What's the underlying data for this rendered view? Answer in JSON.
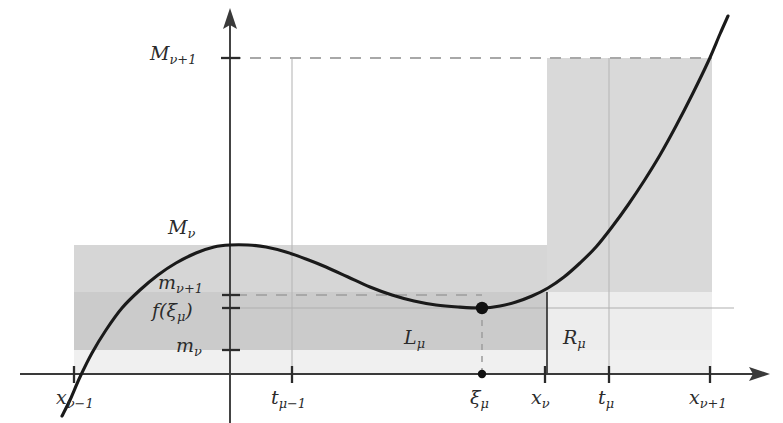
{
  "figure": {
    "type": "mathematical-diagram",
    "background_color": "#ffffff",
    "curve_color": "#1a1a1a",
    "band_color_dark": "#cfcfcf",
    "band_color_mid": "#dcdcdc",
    "band_color_light": "#ebebeb",
    "axis_color": "#3a3a3a",
    "guide_color": "#b5b5b5",
    "dashed_color": "#a8a8a8"
  },
  "y_axis_labels": {
    "m_upper_nu_plus_1": {
      "base": "M",
      "sub": "ν+1",
      "x": 150,
      "y": 54
    },
    "m_upper_nu": {
      "base": "M",
      "sub": "ν",
      "x": 168,
      "y": 228
    },
    "m_lower_nu_plus_1": {
      "base": "m",
      "sub": "ν+1",
      "x": 160,
      "y": 283
    },
    "f_xi_mu": {
      "base": "f(ξ",
      "sub": "μ",
      "tail": ")",
      "x": 156,
      "y": 312
    },
    "m_lower_nu": {
      "base": "m",
      "sub": "ν",
      "x": 178,
      "y": 346
    }
  },
  "x_axis_labels": {
    "x_nu_minus_1": {
      "base": "x",
      "sub": "ν−1",
      "x": 62,
      "y": 396
    },
    "t_mu_minus_1": {
      "base": "t",
      "sub": "μ−1",
      "x": 272,
      "y": 396
    },
    "xi_mu": {
      "base": "ξ",
      "sub": "μ",
      "x": 470,
      "y": 396
    },
    "x_nu": {
      "base": "x",
      "sub": "ν",
      "x": 532,
      "y": 396
    },
    "t_mu": {
      "base": "t",
      "sub": "μ",
      "x": 598,
      "y": 396
    },
    "x_nu_plus_1": {
      "base": "x",
      "sub": "ν+1",
      "x": 692,
      "y": 396
    }
  },
  "region_labels": {
    "l_mu": {
      "base": "L",
      "sub": "μ",
      "x": 405,
      "y": 338
    },
    "r_mu": {
      "base": "R",
      "sub": "μ",
      "x": 564,
      "y": 338
    }
  },
  "chart_data": {
    "type": "line",
    "title": "",
    "xlabel": "",
    "ylabel": "",
    "axis_origin_px": {
      "x": 230,
      "y": 374
    },
    "x_ticks_px": [
      74,
      292,
      545,
      609,
      710
    ],
    "x_tick_labels": [
      "x_{ν−1}",
      "t_{μ−1}",
      "x_{ν}",
      "t_{μ}",
      "x_{ν+1}"
    ],
    "marked_point_px": {
      "x": 482,
      "y": 308
    },
    "y_levels_px": {
      "M_nu_plus_1": 58,
      "M_nu": 245,
      "m_nu_plus_1": 295,
      "f_xi_mu": 308,
      "m_nu": 350
    },
    "curve_points_px": [
      [
        62,
        416
      ],
      [
        70,
        400
      ],
      [
        80,
        377
      ],
      [
        92,
        353
      ],
      [
        106,
        330
      ],
      [
        122,
        308
      ],
      [
        140,
        290
      ],
      [
        158,
        275
      ],
      [
        176,
        263
      ],
      [
        196,
        253
      ],
      [
        214,
        247
      ],
      [
        230,
        245
      ],
      [
        248,
        245
      ],
      [
        266,
        247
      ],
      [
        286,
        252
      ],
      [
        306,
        259
      ],
      [
        326,
        267
      ],
      [
        348,
        277
      ],
      [
        370,
        287
      ],
      [
        392,
        295
      ],
      [
        414,
        301
      ],
      [
        436,
        305
      ],
      [
        458,
        307
      ],
      [
        482,
        308
      ],
      [
        500,
        306
      ],
      [
        516,
        302
      ],
      [
        532,
        296
      ],
      [
        548,
        288
      ],
      [
        564,
        277
      ],
      [
        580,
        263
      ],
      [
        596,
        247
      ],
      [
        612,
        227
      ],
      [
        628,
        205
      ],
      [
        644,
        181
      ],
      [
        660,
        155
      ],
      [
        676,
        126
      ],
      [
        692,
        95
      ],
      [
        708,
        62
      ],
      [
        720,
        34
      ],
      [
        728,
        16
      ]
    ],
    "shaded_rects_px": [
      {
        "name": "upper-band-left",
        "x": 74,
        "y": 245,
        "w": 473,
        "h": 47,
        "shade": "mid"
      },
      {
        "name": "tall-column-right",
        "x": 547,
        "y": 58,
        "w": 165,
        "h": 234,
        "shade": "mid"
      },
      {
        "name": "mid-band",
        "x": 74,
        "y": 292,
        "w": 473,
        "h": 58,
        "shade": "dark"
      },
      {
        "name": "lower-band",
        "x": 74,
        "y": 350,
        "w": 638,
        "h": 24,
        "shade": "light"
      },
      {
        "name": "right-low-band",
        "x": 547,
        "y": 292,
        "w": 165,
        "h": 58,
        "shade": "light"
      }
    ],
    "dashed_lines_px": [
      {
        "name": "M-nu-plus-1-level",
        "x1": 230,
        "y1": 58,
        "x2": 712,
        "y2": 58
      },
      {
        "name": "m-nu-plus-1-level",
        "x1": 230,
        "y1": 295,
        "x2": 482,
        "y2": 295
      },
      {
        "name": "xi-mu-drop",
        "x1": 482,
        "y1": 308,
        "x2": 482,
        "y2": 374
      }
    ],
    "guide_lines_px": [
      {
        "name": "t-mu-minus-1-vertical",
        "x1": 292,
        "y1": 58,
        "x2": 292,
        "y2": 374
      },
      {
        "name": "t-mu-vertical",
        "x1": 609,
        "y1": 58,
        "x2": 609,
        "y2": 374
      },
      {
        "name": "f-xi-mu-horizontal",
        "x1": 230,
        "y1": 308,
        "x2": 734,
        "y2": 308
      }
    ],
    "solid_separator_px": [
      {
        "name": "x-nu-vertical",
        "x1": 547,
        "y1": 292,
        "x2": 547,
        "y2": 374
      }
    ]
  }
}
